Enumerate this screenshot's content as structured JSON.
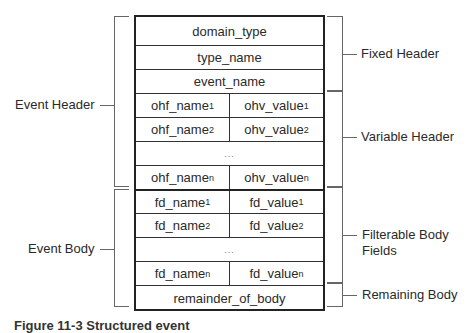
{
  "table": {
    "fixed_header": [
      "domain_type",
      "type_name",
      "event_name"
    ],
    "variable_header": [
      {
        "name": "ohf_name",
        "name_sub": "1",
        "value": "ohv_value",
        "value_sub": "1"
      },
      {
        "name": "ohf_name",
        "name_sub": "2",
        "value": "ohv_value",
        "value_sub": "2"
      },
      {
        "ellipsis": "..."
      },
      {
        "name": "ohf_name",
        "name_sub": "n",
        "value": "ohv_value",
        "value_sub": "n"
      }
    ],
    "filterable_body": [
      {
        "name": "fd_name",
        "name_sub": "1",
        "value": "fd_value",
        "value_sub": "1"
      },
      {
        "name": "fd_name",
        "name_sub": "2",
        "value": "fd_value",
        "value_sub": "2"
      },
      {
        "ellipsis": "..."
      },
      {
        "name": "fd_name",
        "name_sub": "n",
        "value": "fd_value",
        "value_sub": "n"
      }
    ],
    "remaining_body": "remainder_of_body"
  },
  "left_labels": {
    "event_header": "Event Header",
    "event_body": "Event Body"
  },
  "right_labels": {
    "fixed_header": "Fixed Header",
    "variable_header": "Variable Header",
    "filterable_body_line1": "Filterable Body",
    "filterable_body_line2": "Fields",
    "remaining_body": "Remaining Body"
  },
  "caption": "Figure 11-3  Structured event"
}
